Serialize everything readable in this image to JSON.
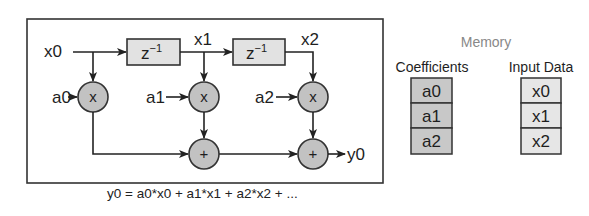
{
  "diagram": {
    "delay_label_base": "z",
    "delay_label_exp": "−1",
    "signals": {
      "x0": "x0",
      "x1": "x1",
      "x2": "x2",
      "y0": "y0"
    },
    "coefficients_inputs": [
      "a0",
      "a1",
      "a2"
    ],
    "multiply_symbol": "x",
    "add_symbol": "+",
    "equation": "y0 = a0*x0 + a1*x1 + a2*x2 + ..."
  },
  "memory": {
    "title": "Memory",
    "coefficients": {
      "header": "Coefficients",
      "cells": [
        "a0",
        "a1",
        "a2"
      ]
    },
    "input_data": {
      "header": "Input Data",
      "cells": [
        "x0",
        "x1",
        "x2"
      ]
    }
  },
  "colors": {
    "coef_cell": "#c8c8c8",
    "input_cell": "#e6e6e6",
    "node_fill": "#c2c2c2",
    "delay_fill": "#e2e2e2",
    "memory_title": "#888888"
  }
}
